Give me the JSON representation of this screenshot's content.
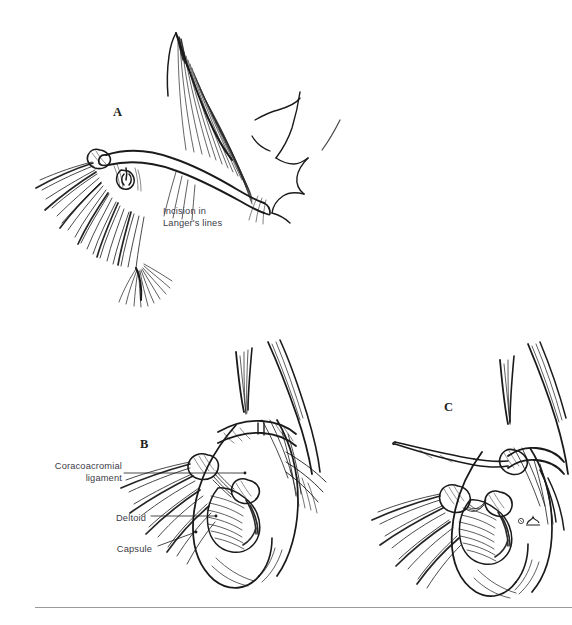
{
  "figure": {
    "kind": "medical-line-illustration",
    "background_color": "#ffffff",
    "ink_color": "#1a1a1a",
    "label_text_color": "#3c3c46",
    "rule_color": "#9a9a9e",
    "panels": [
      {
        "letter": "A",
        "letter_x": 113,
        "letter_y": 105,
        "description": "Skin surface view of neck, clavicle and shoulder showing planned skin incision"
      },
      {
        "letter": "B",
        "letter_x": 140,
        "letter_y": 437,
        "description": "Deep dissection exposing coracoacromial ligament, deltoid and joint capsule"
      },
      {
        "letter": "C",
        "letter_x": 444,
        "letter_y": 400,
        "description": "Elevation of the deltoid off the acromion with a periosteal elevator"
      }
    ],
    "annotations": [
      {
        "id": "incision-langers-lines",
        "text": "Incision in\nLanger's lines",
        "x": 163,
        "y": 206,
        "align": "left",
        "leader": false
      },
      {
        "id": "coracoacromial-ligament",
        "text": "Coracoacromial\nligament",
        "x": 46,
        "y": 461,
        "align": "right",
        "leader": true
      },
      {
        "id": "deltoid",
        "text": "Deltoid",
        "x": 118,
        "y": 513,
        "align": "right",
        "leader": true
      },
      {
        "id": "capsule",
        "text": "Capsule",
        "x": 122,
        "y": 544,
        "align": "right",
        "leader": true
      }
    ],
    "signature": {
      "symbol": "©",
      "x": 520,
      "y": 519
    },
    "footer_rule": {
      "x": 35,
      "y": 607,
      "width": 537
    },
    "caption_sliver": ""
  }
}
